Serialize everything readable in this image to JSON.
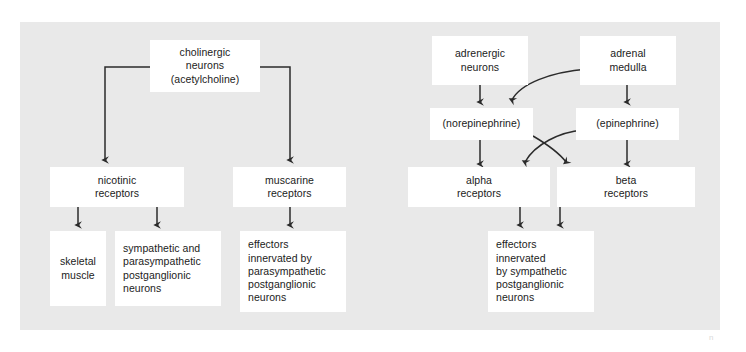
{
  "figure": {
    "panel_background": "#e9e9e9",
    "node_background": "#ffffff",
    "line_color": "#2b2b2b",
    "text_color": "#1b1b1b",
    "corner_mark": "n"
  },
  "cholinergic_branch": {
    "source": {
      "label": "cholinergic\nneurons\n(acetylcholine)"
    },
    "receptors": [
      {
        "label": "nicotinic\nreceptors"
      },
      {
        "label": "muscarine\nreceptors"
      }
    ],
    "targets": [
      {
        "label": "skeletal\nmuscle"
      },
      {
        "label": "sympathetic and\nparasympathetic\npostganglionic\nneurons"
      },
      {
        "label": "effectors\ninnervated by\nparasympathetic\npostganglionic\nneurons"
      }
    ]
  },
  "adrenergic_branch": {
    "sources": [
      {
        "label": "adrenergic\nneurons"
      },
      {
        "label": "adrenal\nmedulla"
      }
    ],
    "transmitters": [
      {
        "label": "(norepinephrine)"
      },
      {
        "label": "(epinephrine)"
      }
    ],
    "receptors": [
      {
        "label": "alpha\nreceptors"
      },
      {
        "label": "beta\nreceptors"
      }
    ],
    "targets": [
      {
        "label": "effectors\ninnervated\nby sympathetic\npostganglionic\nneurons"
      }
    ]
  }
}
